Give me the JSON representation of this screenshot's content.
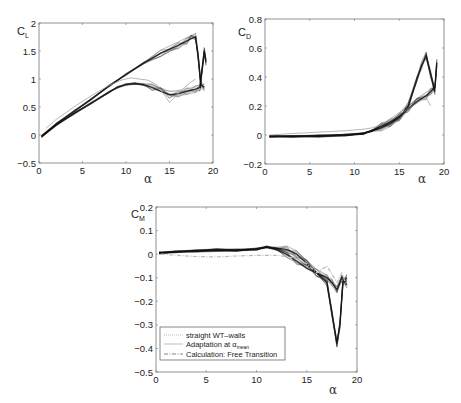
{
  "chart_data": [
    {
      "id": "cl",
      "type": "line",
      "title": "",
      "ylabel": "C_L",
      "ylabel_main": "C",
      "ylabel_sub": "L",
      "xlabel": "α",
      "xlim": [
        0,
        20
      ],
      "ylim": [
        -0.5,
        2
      ],
      "xticks": [
        0,
        5,
        10,
        15,
        20
      ],
      "yticks": [
        -0.5,
        0,
        0.5,
        1,
        1.5,
        2
      ],
      "ytick_labels": [
        "−0.5",
        "0",
        "0.5",
        "1",
        "1.5",
        "2"
      ],
      "frame_px": {
        "x0": 39,
        "x1": 213,
        "y0": 23,
        "y1": 163
      },
      "series": [
        {
          "name": "straight WT-walls",
          "style": "band-dark",
          "color": "#111111",
          "x": [
            0.3,
            2,
            4,
            6,
            8,
            9,
            10,
            11,
            12,
            13,
            14,
            15,
            16,
            17,
            18,
            18.5,
            19,
            19.2
          ],
          "y": [
            -0.03,
            0.18,
            0.38,
            0.57,
            0.76,
            0.85,
            0.9,
            0.92,
            0.9,
            0.85,
            0.78,
            0.72,
            0.74,
            0.78,
            0.82,
            0.85,
            1.5,
            1.3
          ]
        },
        {
          "name": "Adaptation at α_mean",
          "style": "band-dark",
          "color": "#111111",
          "x": [
            0.3,
            2,
            4,
            6,
            8,
            10,
            12,
            14,
            16,
            17,
            17.5,
            18,
            18.3,
            18.6,
            19
          ],
          "y": [
            -0.02,
            0.2,
            0.42,
            0.64,
            0.87,
            1.08,
            1.28,
            1.46,
            1.6,
            1.68,
            1.72,
            1.75,
            1.4,
            0.9,
            0.85
          ]
        },
        {
          "name": "Calculation: Free Transition",
          "style": "light",
          "color": "#999999",
          "x": [
            0.8,
            2,
            4,
            6,
            8,
            9.5,
            10.5,
            11.5,
            12.5,
            13.5,
            14.5,
            15,
            15.5,
            16.5,
            17.5,
            18
          ],
          "y": [
            0.12,
            0.28,
            0.5,
            0.7,
            0.88,
            0.98,
            1.02,
            1.0,
            0.98,
            0.9,
            0.7,
            0.58,
            0.66,
            0.82,
            0.95,
            1.0
          ]
        }
      ]
    },
    {
      "id": "cd",
      "type": "line",
      "title": "",
      "ylabel": "C_D",
      "ylabel_main": "C",
      "ylabel_sub": "D",
      "xlabel": "α",
      "xlim": [
        0,
        20
      ],
      "ylim": [
        -0.2,
        0.8
      ],
      "xticks": [
        0,
        5,
        10,
        15,
        20
      ],
      "yticks": [
        -0.2,
        0,
        0.2,
        0.4,
        0.6,
        0.8
      ],
      "ytick_labels": [
        "−0.2",
        "0",
        "0.2",
        "0.4",
        "0.6",
        "0.8"
      ],
      "frame_px": {
        "x0": 265,
        "x1": 444,
        "y0": 19,
        "y1": 164
      },
      "series": [
        {
          "name": "straight WT-walls",
          "style": "band-dark",
          "color": "#111111",
          "x": [
            0.5,
            3,
            6,
            9,
            11,
            12,
            13,
            14,
            15,
            16,
            17,
            18,
            18.5,
            19,
            19.2
          ],
          "y": [
            -0.01,
            -0.01,
            -0.005,
            0.0,
            0.01,
            0.03,
            0.06,
            0.09,
            0.13,
            0.18,
            0.23,
            0.27,
            0.3,
            0.33,
            0.5
          ]
        },
        {
          "name": "Adaptation at α_mean",
          "style": "band-dark",
          "color": "#111111",
          "x": [
            0.5,
            3,
            6,
            9,
            11,
            12,
            13,
            14,
            15,
            16,
            17,
            17.5,
            18,
            18.5,
            19
          ],
          "y": [
            -0.01,
            -0.01,
            -0.01,
            0.0,
            0.01,
            0.03,
            0.05,
            0.08,
            0.12,
            0.2,
            0.38,
            0.48,
            0.55,
            0.42,
            0.3
          ]
        },
        {
          "name": "Calculation: Free Transition",
          "style": "light",
          "color": "#999999",
          "x": [
            0.5,
            3,
            6,
            9,
            11,
            12,
            13,
            14,
            15,
            16,
            17,
            18,
            18.5
          ],
          "y": [
            0.0,
            0.01,
            0.02,
            0.03,
            0.04,
            0.05,
            0.07,
            0.1,
            0.14,
            0.18,
            0.22,
            0.26,
            0.2
          ]
        }
      ]
    },
    {
      "id": "cm",
      "type": "line",
      "title": "",
      "ylabel": "C_M",
      "ylabel_main": "C",
      "ylabel_sub": "M",
      "xlabel": "α",
      "xlim": [
        0,
        20
      ],
      "ylim": [
        -0.5,
        0.2
      ],
      "xticks": [
        0,
        5,
        10,
        15,
        20
      ],
      "yticks": [
        -0.5,
        -0.4,
        -0.3,
        -0.2,
        -0.1,
        0,
        0.1,
        0.2
      ],
      "ytick_labels": [
        "−0.5",
        "−0.4",
        "−0.3",
        "−0.2",
        "−0.1",
        "0",
        "0.1",
        "0.2"
      ],
      "frame_px": {
        "x0": 156,
        "x1": 357,
        "y0": 207,
        "y1": 372
      },
      "legend": {
        "position": "lower left",
        "entries": [
          {
            "label": "straight WT–walls",
            "style": "dotted-light"
          },
          {
            "label_main": "Adaptation at α",
            "label_sub": "mean",
            "style": "solid-light"
          },
          {
            "label": "Calculation: Free Transition",
            "style": "dashdot"
          }
        ]
      },
      "series": [
        {
          "name": "straight WT-walls",
          "style": "band-dark",
          "color": "#111111",
          "x": [
            0.3,
            2,
            4,
            6,
            8,
            10,
            11,
            12,
            13,
            14,
            15,
            16,
            17,
            17.5,
            18,
            18.5,
            19
          ],
          "y": [
            0.005,
            0.01,
            0.012,
            0.015,
            0.015,
            0.02,
            0.03,
            0.02,
            0.0,
            -0.03,
            -0.06,
            -0.08,
            -0.1,
            -0.12,
            -0.15,
            -0.1,
            -0.13
          ]
        },
        {
          "name": "Adaptation at α_mean",
          "style": "band-dark",
          "color": "#111111",
          "x": [
            0.3,
            2,
            4,
            6,
            8,
            10,
            11,
            12,
            13,
            14,
            15,
            16,
            17,
            17.5,
            18,
            18.3,
            18.6,
            19
          ],
          "y": [
            0.005,
            0.01,
            0.015,
            0.02,
            0.018,
            0.022,
            0.03,
            0.025,
            0.02,
            0.0,
            -0.04,
            -0.08,
            -0.12,
            -0.25,
            -0.38,
            -0.3,
            -0.12,
            -0.1
          ]
        },
        {
          "name": "Calculation: Free Transition",
          "style": "dashdot",
          "color": "#666666",
          "x": [
            0.5,
            2,
            4,
            6,
            8,
            10,
            12,
            13,
            14,
            15,
            16,
            17,
            18,
            18.5,
            19
          ],
          "y": [
            0.0,
            -0.005,
            -0.01,
            -0.012,
            -0.008,
            -0.005,
            -0.005,
            -0.01,
            -0.02,
            -0.04,
            -0.08,
            -0.05,
            -0.12,
            -0.08,
            -0.14
          ]
        }
      ]
    }
  ]
}
